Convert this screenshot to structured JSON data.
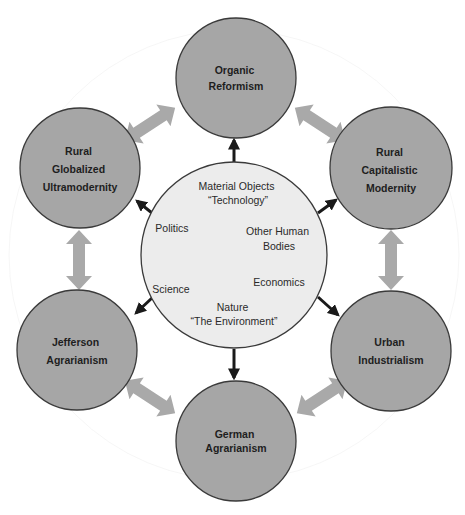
{
  "diagram": {
    "type": "hub-and-spoke concept diagram",
    "colors": {
      "outer_fill": "#a6a6a6",
      "outer_stroke": "#3a3a3a",
      "center_fill": "#ececec",
      "center_stroke": "#3a3a3a",
      "block_arrow": "#a9a9a9",
      "spoke_arrow": "#1a1a1a",
      "background": "#ffffff"
    },
    "center": {
      "labels": [
        {
          "id": "material-objects",
          "lines": [
            "Material Objects",
            "“Technology”"
          ]
        },
        {
          "id": "politics",
          "lines": [
            "Politics"
          ]
        },
        {
          "id": "other-human-bodies",
          "lines": [
            "Other Human",
            "Bodies"
          ]
        },
        {
          "id": "science",
          "lines": [
            "Science"
          ]
        },
        {
          "id": "economics",
          "lines": [
            "Economics"
          ]
        },
        {
          "id": "nature",
          "lines": [
            "Nature",
            "“The Environment”"
          ]
        }
      ]
    },
    "nodes": [
      {
        "id": "organic-reformism",
        "lines": [
          "Organic",
          "Reformism"
        ]
      },
      {
        "id": "rural-capitalistic-modernity",
        "lines": [
          "Rural",
          "Capitalistic",
          "Modernity"
        ]
      },
      {
        "id": "urban-industrialism",
        "lines": [
          "Urban",
          "Industrialism"
        ]
      },
      {
        "id": "german-agrarianism",
        "lines": [
          "German",
          "Agrarianism"
        ]
      },
      {
        "id": "jefferson-agrarianism",
        "lines": [
          "Jefferson",
          "Agrarianism"
        ]
      },
      {
        "id": "rural-globalized-ultramodernity",
        "lines": [
          "Rural",
          "Globalized",
          "Ultramodernity"
        ]
      }
    ],
    "connections": {
      "spokes_from_center": [
        "organic-reformism",
        "rural-capitalistic-modernity",
        "urban-industrialism",
        "german-agrarianism",
        "jefferson-agrarianism",
        "rural-globalized-ultramodernity"
      ],
      "bidirectional_between_neighbors": [
        [
          "rural-globalized-ultramodernity",
          "organic-reformism"
        ],
        [
          "organic-reformism",
          "rural-capitalistic-modernity"
        ],
        [
          "rural-capitalistic-modernity",
          "urban-industrialism"
        ],
        [
          "urban-industrialism",
          "german-agrarianism"
        ],
        [
          "german-agrarianism",
          "jefferson-agrarianism"
        ],
        [
          "jefferson-agrarianism",
          "rural-globalized-ultramodernity"
        ]
      ]
    }
  }
}
